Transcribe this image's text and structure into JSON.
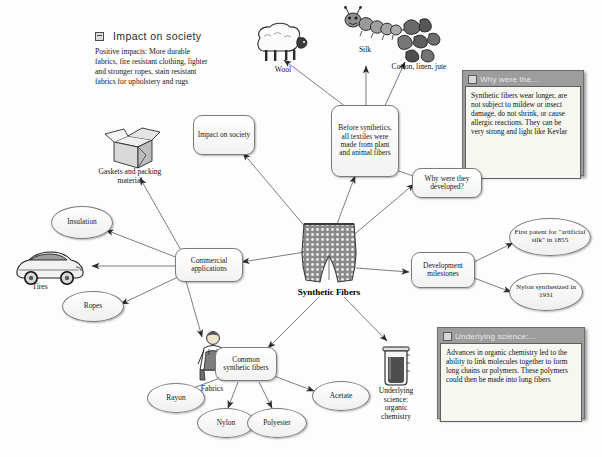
{
  "page": {
    "background": "#fdfdfd"
  },
  "center": {
    "label": "Synthetic Fibers",
    "icon": "fabric-shorts-image"
  },
  "freetext": {
    "heading": "Impact on society",
    "heading_icon": "note-bullet-icon",
    "body": "Positive impacts: More durable fabrics, fire resistant clothing, lighter and stronger ropes, stain resistant fabrics for upholstery and rugs"
  },
  "nodes": {
    "impact_on_society": "Impact on society",
    "before_synthetics": "Before synthetics, all textiles were made from plant and animal fibers",
    "why_developed": "Why were they developed?",
    "development_milestones": "Development milestones",
    "first_patent": "First patent for \"artificial silk\" in 1855",
    "nylon_synthesized": "Nylon synthesized in 1931",
    "commercial_applications": "Commercial applications",
    "insulation": "Insulation",
    "ropes": "Ropes",
    "common_synthetic_fibers": "Common synthetic fibers",
    "rayon": "Rayon",
    "nylon": "Nylon",
    "polyester": "Polyester",
    "acetate": "Acetate"
  },
  "picture_labels": {
    "wool": "Wool",
    "silk": "Silk",
    "cotton_linen_jute": "Cotton, linen, jute",
    "gaskets": "Gaskets and packing material",
    "tires": "Tires",
    "fabrics": "Fabrics",
    "underlying_science_beaker": "Underlying science: organic chemistry"
  },
  "picture_icons": {
    "wool": "sheep-icon",
    "silk": "caterpillar-icon",
    "cotton": "cotton-bolls-icon",
    "gaskets": "open-box-icon",
    "tires": "car-icon",
    "fabrics": "person-overalls-icon",
    "beaker": "beaker-icon"
  },
  "notes": [
    {
      "id": "why-were-they-note",
      "title": "Why were the...",
      "title_icon": "note-window-icon",
      "body": "Synthetic fibers wear longer, are not subject to mildew or insect damage, do not shrink, or cause allergic reactions. They can be very strong and light like Kevlar"
    },
    {
      "id": "underlying-science-note",
      "title": "Underlying science:...",
      "title_icon": "note-window-icon",
      "body": "Advances in organic chemistry led to the ability to link molecules together to form long chains or polymers. These polymers could then be made into long fibers"
    }
  ],
  "colors": {
    "line": "#6f6f6f",
    "node_border": "#7b7b7b",
    "note_frame": "#9d9d9d",
    "note_body": "#f7f7f2",
    "text": "#121212"
  }
}
